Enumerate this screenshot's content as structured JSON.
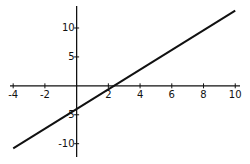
{
  "chart_data": {
    "type": "line",
    "title": "",
    "xlabel": "",
    "ylabel": "",
    "xlim": [
      -4.2,
      10.3
    ],
    "ylim": [
      -12.3,
      13.8
    ],
    "grid": false,
    "legend": "none",
    "x_ticks": [
      -4,
      -2,
      2,
      4,
      6,
      8,
      10
    ],
    "x_tick_labels": [
      "-4",
      "-2",
      "2",
      "4",
      "6",
      "8",
      "10"
    ],
    "y_ticks": [
      10,
      5,
      -5,
      -10
    ],
    "y_tick_labels": [
      "10",
      "5",
      "-5",
      "-10"
    ],
    "series": [
      {
        "name": "y = 1.7x - 4",
        "x": [
          -4,
          10
        ],
        "y": [
          -10.8,
          13
        ]
      }
    ],
    "colors": {
      "axis": "#111111",
      "line": "#111111"
    }
  }
}
